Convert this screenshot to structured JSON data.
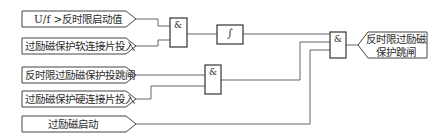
{
  "diagram": {
    "type": "logic-block-diagram",
    "inputs": [
      {
        "id": "in1",
        "label": "U/f >反时限启动值"
      },
      {
        "id": "in2",
        "label": "过励磁保护软连接片投入"
      },
      {
        "id": "in3",
        "label": "反时限过励磁保护投跳闸"
      },
      {
        "id": "in4",
        "label": "过励磁保护硬连接片投入"
      },
      {
        "id": "in5",
        "label": "过励磁启动"
      }
    ],
    "gates": [
      {
        "id": "and1",
        "symbol": "&",
        "inputs": [
          "in1",
          "in2"
        ]
      },
      {
        "id": "int1",
        "symbol": "∫",
        "inputs": [
          "and1"
        ]
      },
      {
        "id": "and2",
        "symbol": "&",
        "inputs": [
          "in3",
          "in4"
        ]
      },
      {
        "id": "and3",
        "symbol": "&",
        "inputs": [
          "int1",
          "and2",
          "in5"
        ]
      }
    ],
    "output": {
      "id": "out1",
      "line1": "反时限过励磁",
      "line2": "保护跳闸",
      "from": "and3"
    },
    "colors": {
      "line": "#555555",
      "box": "#333333",
      "background": "#ffffff"
    }
  }
}
